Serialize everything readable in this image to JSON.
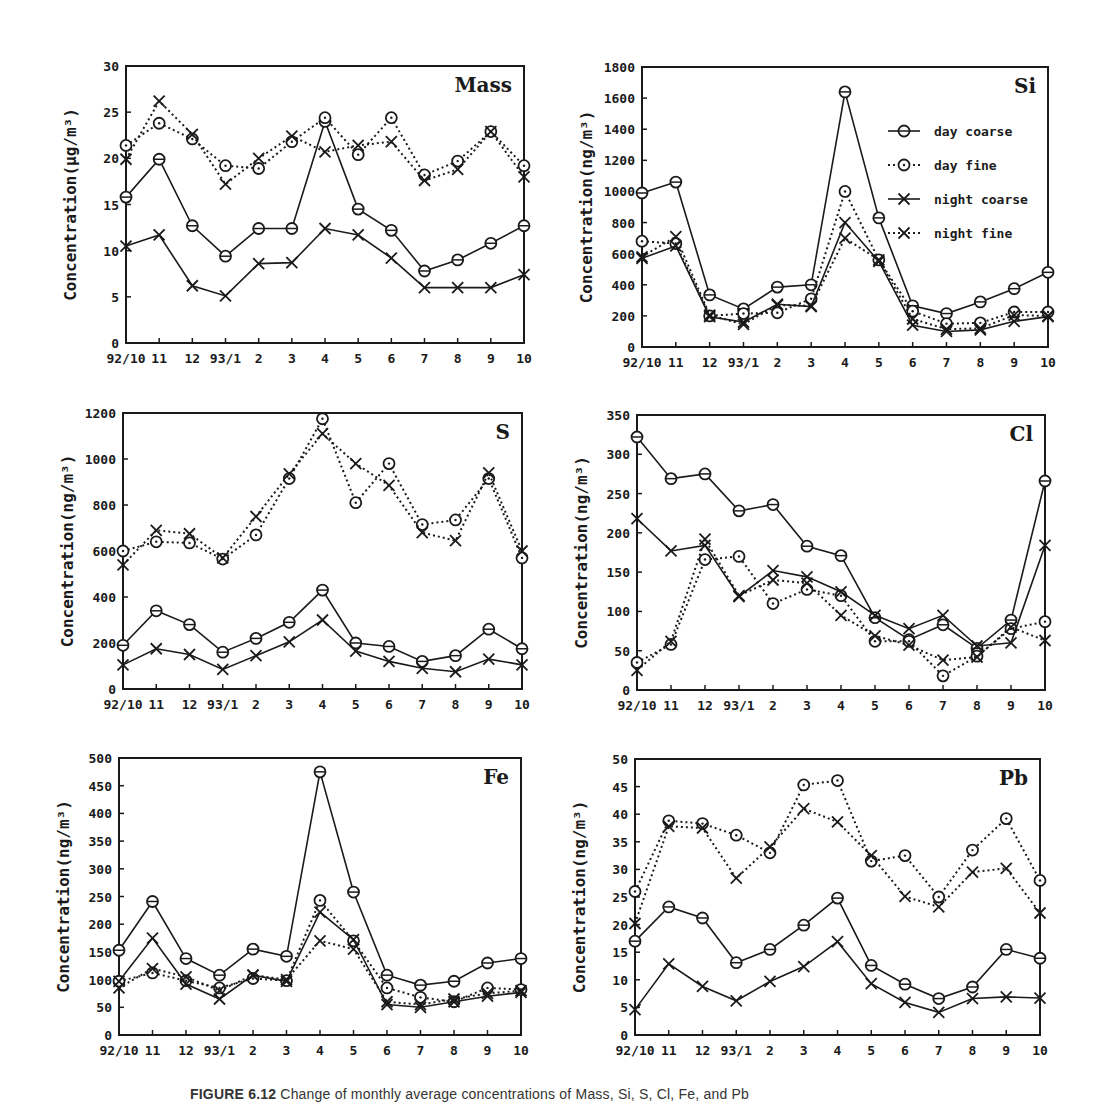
{
  "figure": {
    "caption_label": "FIGURE 6.12",
    "caption_text": "Change of monthly average concentrations of Mass, Si, S, Cl, Fe, and Pb"
  },
  "legend": {
    "items": [
      {
        "label": "day coarse",
        "marker": "circle",
        "line": "solid"
      },
      {
        "label": "day fine",
        "marker": "circle",
        "line": "dotted"
      },
      {
        "label": "night coarse",
        "marker": "x",
        "line": "solid"
      },
      {
        "label": "night fine",
        "marker": "x",
        "line": "dotted"
      }
    ]
  },
  "chart_data": [
    {
      "type": "line",
      "title": "Mass",
      "xlabel": "",
      "ylabel": "Concentration(µg/m³)",
      "categories": [
        "92/10",
        "11",
        "12",
        "93/1",
        "2",
        "3",
        "4",
        "5",
        "6",
        "7",
        "8",
        "9",
        "10"
      ],
      "yticks": [
        0,
        5,
        10,
        15,
        20,
        25,
        30
      ],
      "ylim": [
        0,
        30
      ],
      "grid": false,
      "series": [
        {
          "name": "day coarse",
          "values": [
            15.8,
            19.9,
            12.7,
            9.4,
            12.4,
            12.4,
            24.0,
            14.5,
            12.2,
            7.8,
            9.0,
            10.8,
            12.7
          ]
        },
        {
          "name": "day fine",
          "values": [
            21.4,
            23.8,
            22.1,
            19.2,
            18.9,
            21.8,
            24.4,
            20.4,
            24.4,
            18.2,
            19.7,
            22.9,
            19.2
          ]
        },
        {
          "name": "night coarse",
          "values": [
            10.5,
            11.7,
            6.2,
            5.1,
            8.6,
            8.7,
            12.4,
            11.7,
            9.2,
            6.0,
            6.0,
            6.0,
            7.4
          ]
        },
        {
          "name": "night fine",
          "values": [
            19.9,
            26.2,
            22.6,
            17.2,
            20.0,
            22.4,
            20.7,
            21.4,
            21.8,
            17.6,
            18.8,
            22.9,
            18.0
          ]
        }
      ]
    },
    {
      "type": "line",
      "title": "Si",
      "xlabel": "",
      "ylabel": "Concentration(ng/m³)",
      "categories": [
        "92/10",
        "11",
        "12",
        "93/1",
        "2",
        "3",
        "4",
        "5",
        "6",
        "7",
        "8",
        "9",
        "10"
      ],
      "yticks": [
        0,
        200,
        400,
        600,
        800,
        1000,
        1200,
        1400,
        1600,
        1800
      ],
      "ylim": [
        0,
        1800
      ],
      "grid": false,
      "legend_position": "upper right",
      "series": [
        {
          "name": "day coarse",
          "values": [
            990,
            1060,
            335,
            245,
            385,
            400,
            1640,
            830,
            265,
            215,
            290,
            375,
            480
          ]
        },
        {
          "name": "day fine",
          "values": [
            680,
            665,
            200,
            215,
            220,
            310,
            1000,
            560,
            230,
            150,
            155,
            225,
            225
          ]
        },
        {
          "name": "night coarse",
          "values": [
            570,
            650,
            195,
            160,
            275,
            260,
            800,
            550,
            140,
            100,
            110,
            165,
            195
          ]
        },
        {
          "name": "night fine",
          "values": [
            580,
            710,
            205,
            145,
            270,
            265,
            700,
            560,
            180,
            115,
            120,
            205,
            200
          ]
        }
      ]
    },
    {
      "type": "line",
      "title": "S",
      "xlabel": "",
      "ylabel": "Concentration(ng/m³)",
      "categories": [
        "92/10",
        "11",
        "12",
        "93/1",
        "2",
        "3",
        "4",
        "5",
        "6",
        "7",
        "8",
        "9",
        "10"
      ],
      "yticks": [
        0,
        200,
        400,
        600,
        800,
        1000,
        1200
      ],
      "ylim": [
        0,
        1200
      ],
      "grid": false,
      "series": [
        {
          "name": "day coarse",
          "values": [
            190,
            340,
            280,
            160,
            220,
            290,
            430,
            200,
            185,
            120,
            145,
            260,
            175
          ]
        },
        {
          "name": "day fine",
          "values": [
            600,
            640,
            635,
            565,
            670,
            915,
            1175,
            810,
            980,
            715,
            735,
            915,
            570
          ]
        },
        {
          "name": "night coarse",
          "values": [
            105,
            175,
            150,
            85,
            145,
            205,
            300,
            165,
            120,
            90,
            75,
            130,
            105
          ]
        },
        {
          "name": "night fine",
          "values": [
            540,
            690,
            675,
            570,
            750,
            935,
            1110,
            980,
            885,
            680,
            645,
            940,
            600
          ]
        }
      ]
    },
    {
      "type": "line",
      "title": "Cl",
      "xlabel": "",
      "ylabel": "Concentration(ng/m³)",
      "categories": [
        "92/10",
        "11",
        "12",
        "93/1",
        "2",
        "3",
        "4",
        "5",
        "6",
        "7",
        "8",
        "9",
        "10"
      ],
      "yticks": [
        0,
        50,
        100,
        150,
        200,
        250,
        300,
        350
      ],
      "ylim": [
        0,
        350
      ],
      "grid": false,
      "series": [
        {
          "name": "day coarse",
          "values": [
            322,
            269,
            275,
            228,
            236,
            183,
            171,
            92,
            64,
            83,
            53,
            89,
            266
          ]
        },
        {
          "name": "day fine",
          "values": [
            35,
            58,
            166,
            170,
            110,
            128,
            120,
            62,
            62,
            18,
            43,
            78,
            87
          ]
        },
        {
          "name": "night coarse",
          "values": [
            218,
            177,
            184,
            119,
            152,
            144,
            125,
            95,
            78,
            95,
            56,
            60,
            184
          ]
        },
        {
          "name": "night fine",
          "values": [
            25,
            62,
            192,
            120,
            140,
            136,
            95,
            69,
            57,
            38,
            42,
            80,
            63
          ]
        }
      ]
    },
    {
      "type": "line",
      "title": "Fe",
      "xlabel": "",
      "ylabel": "Concentration(ng/m³)",
      "categories": [
        "92/10",
        "11",
        "12",
        "93/1",
        "2",
        "3",
        "4",
        "5",
        "6",
        "7",
        "8",
        "9",
        "10"
      ],
      "yticks": [
        0,
        50,
        100,
        150,
        200,
        250,
        300,
        350,
        400,
        450,
        500
      ],
      "ylim": [
        0,
        500
      ],
      "grid": false,
      "series": [
        {
          "name": "day coarse",
          "values": [
            153,
            241,
            138,
            108,
            155,
            142,
            475,
            258,
            108,
            90,
            97,
            130,
            138
          ]
        },
        {
          "name": "day fine",
          "values": [
            97,
            112,
            98,
            85,
            102,
            98,
            243,
            170,
            85,
            68,
            60,
            85,
            82
          ]
        },
        {
          "name": "night coarse",
          "values": [
            97,
            175,
            92,
            65,
            108,
            97,
            222,
            172,
            55,
            50,
            60,
            70,
            77
          ]
        },
        {
          "name": "night fine",
          "values": [
            85,
            120,
            105,
            80,
            108,
            100,
            170,
            155,
            60,
            55,
            65,
            75,
            80
          ]
        }
      ]
    },
    {
      "type": "line",
      "title": "Pb",
      "xlabel": "",
      "ylabel": "Concentration(ng/m³)",
      "categories": [
        "92/10",
        "11",
        "12",
        "93/1",
        "2",
        "3",
        "4",
        "5",
        "6",
        "7",
        "8",
        "9",
        "10"
      ],
      "yticks": [
        0,
        5,
        10,
        15,
        20,
        25,
        30,
        35,
        40,
        45,
        50
      ],
      "ylim": [
        0,
        50
      ],
      "grid": false,
      "series": [
        {
          "name": "day coarse",
          "values": [
            17.0,
            23.2,
            21.2,
            13.1,
            15.5,
            19.9,
            24.8,
            12.6,
            9.2,
            6.6,
            8.7,
            15.5,
            13.9
          ]
        },
        {
          "name": "day fine",
          "values": [
            26.0,
            38.8,
            38.3,
            36.2,
            33.0,
            45.3,
            46.1,
            31.5,
            32.5,
            25.0,
            33.5,
            39.2,
            28.0
          ]
        },
        {
          "name": "night coarse",
          "values": [
            4.6,
            12.9,
            8.8,
            6.2,
            9.7,
            12.4,
            16.9,
            9.3,
            5.9,
            4.1,
            6.6,
            6.9,
            6.7
          ]
        },
        {
          "name": "night fine",
          "values": [
            20.2,
            37.8,
            37.5,
            28.4,
            34.1,
            41.0,
            38.6,
            32.5,
            25.1,
            23.2,
            29.5,
            30.2,
            22.1
          ]
        }
      ]
    }
  ]
}
